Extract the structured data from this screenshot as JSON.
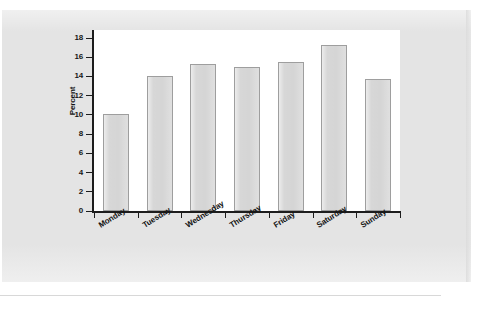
{
  "chart_data": {
    "type": "bar",
    "title": "",
    "subtitle": "",
    "xlabel": "",
    "ylabel": "Percent",
    "categories": [
      "Monday",
      "Tuesday",
      "Wednesday",
      "Thursday",
      "Friday",
      "Saturday",
      "Sunday"
    ],
    "values": [
      10.1,
      14.0,
      15.3,
      15.0,
      15.5,
      17.3,
      13.7
    ],
    "ylim": [
      0,
      18
    ],
    "yticks": [
      0,
      2,
      4,
      6,
      8,
      10,
      12,
      14,
      16,
      18
    ],
    "ytick_labels": [
      "0",
      "2",
      "4",
      "6",
      "8",
      "10",
      "12",
      "14",
      "16",
      "18"
    ],
    "grid": false,
    "legend": null,
    "legend_position": "none",
    "bar_fill_color": "#d5d5d5",
    "bar_edge_color": "#9e9e9e",
    "axis_color": "#1d1d1d",
    "plot_background": "#ffffff",
    "page_background": "#e4e4e4",
    "xtick_label_rotation": -32
  }
}
